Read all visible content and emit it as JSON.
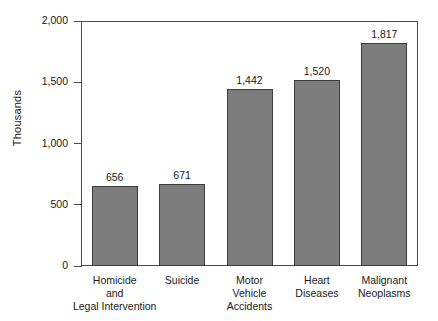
{
  "chart_data": {
    "type": "bar",
    "title": "",
    "xlabel": "",
    "ylabel": "Thousands",
    "ylim": [
      0,
      2000
    ],
    "yticks": [
      0,
      500,
      1000,
      1500,
      2000
    ],
    "ytick_labels": [
      "0",
      "500",
      "1,000",
      "1,500",
      "2,000"
    ],
    "grid": false,
    "legend": null,
    "bar_color": "#7d7d7d",
    "bar_edge_color": "#3d3d3d",
    "categories": [
      "Homicide and Legal Intervention",
      "Suicide",
      "Motor Vehicle Accidents",
      "Heart Diseases",
      "Malignant Neoplasms"
    ],
    "category_lines": [
      [
        "Homicide",
        "and",
        "Legal Intervention"
      ],
      [
        "Suicide"
      ],
      [
        "Motor",
        "Vehicle",
        "Accidents"
      ],
      [
        "Heart",
        "Diseases"
      ],
      [
        "Malignant",
        "Neoplasms"
      ]
    ],
    "values": [
      656,
      671,
      1442,
      1520,
      1817
    ],
    "value_labels": [
      "656",
      "671",
      "1,442",
      "1,520",
      "1,817"
    ]
  }
}
